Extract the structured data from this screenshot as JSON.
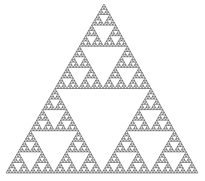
{
  "figure": {
    "name": "sierpinski-triangle",
    "canvas": {
      "width": 205,
      "height": 181,
      "background_color": "#ffffff"
    }
  },
  "chart_data": {
    "type": "diagram",
    "subtype": "fractal",
    "name": "Sierpinski triangle",
    "title": "",
    "xlabel": "",
    "ylabel": "",
    "grid": false,
    "legend": false,
    "axes_visible": false,
    "construction": {
      "rule": "recursive-subdivision",
      "description": "Each equilateral triangle is subdivided into 4 congruent sub-triangles; the central inverted triangle is removed and the 3 corner triangles are recursed.",
      "depth": 6,
      "branching_factor": 3,
      "scale_factor": 0.5,
      "hausdorff_dimension": 1.585,
      "triangles_at_depth": [
        1,
        3,
        9,
        27,
        81,
        243,
        729
      ],
      "total_drawn_triangles": 729,
      "removed_holes_total": 364
    },
    "geometry": {
      "shape": "equilateral-triangle",
      "apex": [
        104,
        4
      ],
      "bottom_left": [
        6,
        173
      ],
      "bottom_right": [
        198,
        173
      ],
      "base_length": 192,
      "height": 169
    },
    "style": {
      "stroke_color": "#1f1f1f",
      "fill_color": "none",
      "stroke_width": 0.45,
      "background_color": "#ffffff"
    }
  }
}
